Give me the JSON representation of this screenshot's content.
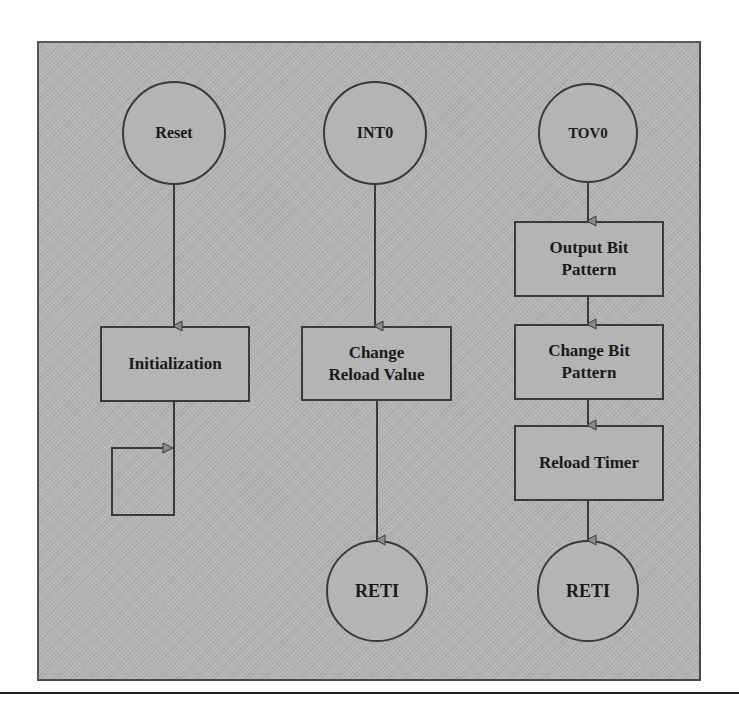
{
  "diagram": {
    "type": "flowchart",
    "background_color": "#b4b4b4",
    "stroke_color": "#3a3a3a",
    "columns": [
      {
        "name": "reset-flow",
        "start": {
          "label": "Reset",
          "shape": "circle"
        },
        "steps": [
          {
            "label": "Initialization",
            "shape": "rectangle"
          }
        ],
        "end": {
          "label": "",
          "shape": "self-loop"
        }
      },
      {
        "name": "int0-flow",
        "start": {
          "label": "INT0",
          "shape": "circle"
        },
        "steps": [
          {
            "label": "Change Reload Value",
            "line1": "Change",
            "line2": "Reload Value",
            "shape": "rectangle"
          }
        ],
        "end": {
          "label": "RETI",
          "shape": "circle"
        }
      },
      {
        "name": "tov0-flow",
        "start": {
          "label": "TOV0",
          "shape": "circle"
        },
        "steps": [
          {
            "label": "Output Bit Pattern",
            "line1": "Output Bit",
            "line2": "Pattern",
            "shape": "rectangle"
          },
          {
            "label": "Change Bit Pattern",
            "line1": "Change Bit",
            "line2": "Pattern",
            "shape": "rectangle"
          },
          {
            "label": "Reload Timer",
            "shape": "rectangle"
          }
        ],
        "end": {
          "label": "RETI",
          "shape": "circle"
        }
      }
    ],
    "edges": [
      {
        "from": "Reset",
        "to": "Initialization"
      },
      {
        "from": "Initialization",
        "to": "Initialization (infinite loop)"
      },
      {
        "from": "INT0",
        "to": "Change Reload Value"
      },
      {
        "from": "Change Reload Value",
        "to": "RETI"
      },
      {
        "from": "TOV0",
        "to": "Output Bit Pattern"
      },
      {
        "from": "Output Bit Pattern",
        "to": "Change Bit Pattern"
      },
      {
        "from": "Change Bit Pattern",
        "to": "Reload Timer"
      },
      {
        "from": "Reload Timer",
        "to": "RETI"
      }
    ]
  }
}
